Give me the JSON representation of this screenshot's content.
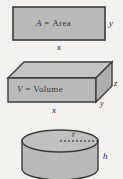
{
  "page": {
    "background_color": "#f2f1ee",
    "width": 123,
    "height": 179
  },
  "style": {
    "fill_color": "#b9b9b9",
    "fill_color_top": "#c4c4c4",
    "fill_color_side": "#aeaeae",
    "stroke_color": "#3c3c3c",
    "text_color": "#2c2c2c"
  },
  "figures": [
    {
      "id": "rectangle",
      "name": "area-rectangle",
      "shape": "rectangle",
      "inner_label_variable": "A",
      "inner_label_operator": "=",
      "inner_label_word": "Area",
      "inner_label_full": "A = Area",
      "labels": [
        {
          "text": "y",
          "position": "right"
        },
        {
          "text": "x",
          "position": "bottom"
        }
      ]
    },
    {
      "id": "box",
      "name": "volume-box",
      "shape": "rectangular-prism",
      "inner_label_variable": "V",
      "inner_label_operator": "=",
      "inner_label_word": "Volume",
      "inner_label_full": "V = Volume",
      "labels": [
        {
          "text": "z",
          "position": "right-edge"
        },
        {
          "text": "y",
          "position": "bottom-right"
        },
        {
          "text": "x",
          "position": "bottom"
        }
      ]
    },
    {
      "id": "cylinder",
      "name": "cylinder",
      "shape": "cylinder",
      "labels": [
        {
          "text": "r",
          "position": "top-radius"
        },
        {
          "text": "h",
          "position": "right-height"
        }
      ]
    }
  ]
}
